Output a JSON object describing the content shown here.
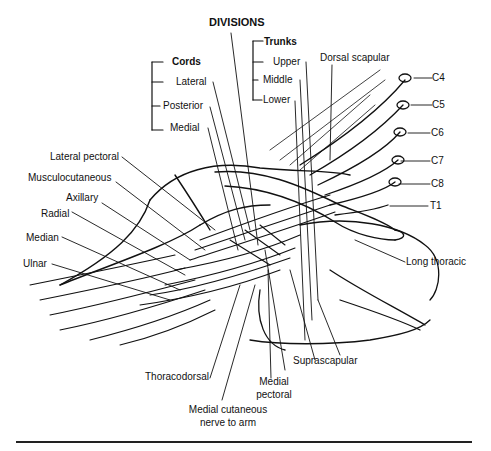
{
  "figure": {
    "headers": {
      "divisions": "DIVISIONS",
      "trunks": "Trunks",
      "cords": "Cords"
    },
    "trunks": [
      "Upper",
      "Middle",
      "Lower"
    ],
    "cords": [
      "Lateral",
      "Posterior",
      "Medial"
    ],
    "roots": [
      "C4",
      "C5",
      "C6",
      "C7",
      "C8",
      "T1"
    ],
    "nerves_left": [
      "Lateral pectoral",
      "Musculocutaneous",
      "Axillary",
      "Radial",
      "Median",
      "Ulnar"
    ],
    "nerves_top_right": [
      "Dorsal scapular"
    ],
    "nerves_right": [
      "Long thoracic"
    ],
    "nerves_bottom": {
      "thoracodorsal": "Thoracodorsal",
      "suprascapular": "Suprascapular",
      "medial_pectoral_line1": "Medial",
      "medial_pectoral_line2": "pectoral",
      "medial_cutaneous_line1": "Medial cutaneous",
      "medial_cutaneous_line2": "nerve to arm"
    }
  }
}
